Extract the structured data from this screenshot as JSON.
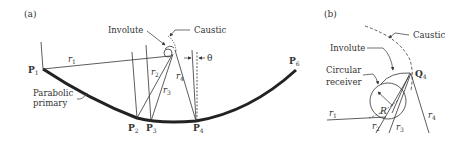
{
  "panel_a": {
    "tag": "(a)",
    "involute": "Involute",
    "caustic": "Caustic",
    "theta": "θ",
    "parabolic_line1": "Parabolic",
    "parabolic_line2": "primary",
    "points": {
      "p1": {
        "main": "P",
        "sub": "1"
      },
      "p2": {
        "main": "P",
        "sub": "2"
      },
      "p3": {
        "main": "P",
        "sub": "3"
      },
      "p4": {
        "main": "P",
        "sub": "4"
      },
      "p6": {
        "main": "P",
        "sub": "6"
      }
    },
    "rays": {
      "r1": {
        "main": "r",
        "sub": "1"
      },
      "r2": {
        "main": "r",
        "sub": "2"
      },
      "r3": {
        "main": "r",
        "sub": "3"
      },
      "r4": {
        "main": "r",
        "sub": "4"
      }
    }
  },
  "panel_b": {
    "tag": "(b)",
    "caustic": "Caustic",
    "involute": "Involute",
    "receiver_line1": "Circular",
    "receiver_line2": "receiver",
    "radius": "R",
    "q4": {
      "main": "Q",
      "sub": "4"
    },
    "rays": {
      "r1": {
        "main": "r",
        "sub": "1"
      },
      "r2": {
        "main": "r",
        "sub": "2"
      },
      "r3": {
        "main": "r",
        "sub": "3"
      },
      "r4": {
        "main": "r",
        "sub": "4"
      }
    }
  },
  "colors": {
    "ink": "#333333",
    "background": "#ffffff"
  }
}
